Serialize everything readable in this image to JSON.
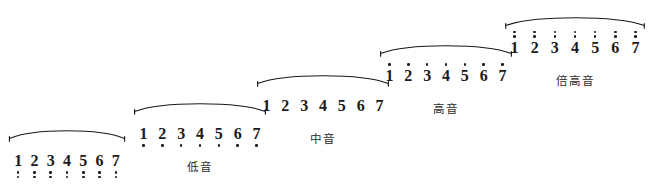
{
  "figure": {
    "ink_color": "#1a1a1a",
    "background_color": "#ffffff"
  },
  "chart_data": {
    "type": "table",
    "xlabel": "",
    "ylabel": "",
    "grid": false,
    "legend": "none",
    "notation": "jianpu",
    "categories": [
      "倍低音",
      "低音",
      "中音",
      "高音",
      "倍高音"
    ],
    "series": [
      {
        "name": "octave_dots",
        "values": [
          -2,
          -1,
          0,
          1,
          2
        ]
      },
      {
        "name": "step_index",
        "values": [
          1,
          2,
          3,
          4,
          5
        ]
      }
    ],
    "degrees": [
      "1",
      "2",
      "3",
      "4",
      "5",
      "6",
      "7"
    ]
  },
  "groups": [
    {
      "label": "倍低音",
      "dots_above": 0,
      "dots_below": 2,
      "left": 8,
      "top": 126,
      "width": 118,
      "digits": [
        "1",
        "2",
        "3",
        "4",
        "5",
        "6",
        "7"
      ]
    },
    {
      "label": "低音",
      "dots_above": 0,
      "dots_below": 1,
      "left": 133,
      "top": 99,
      "width": 134,
      "digits": [
        "1",
        "2",
        "3",
        "4",
        "5",
        "6",
        "7"
      ]
    },
    {
      "label": "中音",
      "dots_above": 0,
      "dots_below": 0,
      "left": 256,
      "top": 71,
      "width": 134,
      "digits": [
        "1",
        "2",
        "3",
        "4",
        "5",
        "6",
        "7"
      ]
    },
    {
      "label": "高音",
      "dots_above": 1,
      "dots_below": 0,
      "left": 379,
      "top": 41,
      "width": 134,
      "digits": [
        "1",
        "2",
        "3",
        "4",
        "5",
        "6",
        "7"
      ]
    },
    {
      "label": "倍高音",
      "dots_above": 2,
      "dots_below": 0,
      "left": 504,
      "top": 13,
      "width": 142,
      "digits": [
        "1",
        "2",
        "3",
        "4",
        "5",
        "6",
        "7"
      ]
    }
  ]
}
